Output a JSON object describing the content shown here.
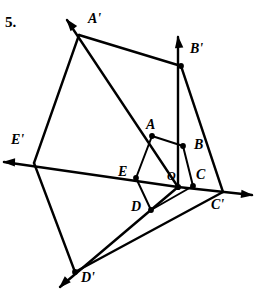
{
  "figure": {
    "problem_number": "5.",
    "stroke_color": "#000000",
    "background_color": "#ffffff",
    "inner_polygon_name": "ABCDE",
    "outer_polygon_name": "A'B'C'D'E'",
    "center_label": "O",
    "labels": {
      "A": "A",
      "B": "B",
      "C": "C",
      "D": "D",
      "E": "E",
      "O": "O",
      "A_prime": "A'",
      "B_prime": "B'",
      "C_prime": "C'",
      "D_prime": "D'",
      "E_prime": "E'"
    },
    "label_positions": {
      "A": {
        "x": 146,
        "y": 118
      },
      "B": {
        "x": 194,
        "y": 138
      },
      "C": {
        "x": 196,
        "y": 168
      },
      "D": {
        "x": 131,
        "y": 200
      },
      "E": {
        "x": 118,
        "y": 165
      },
      "O": {
        "x": 167,
        "y": 170
      },
      "A_prime": {
        "x": 88,
        "y": 12
      },
      "B_prime": {
        "x": 190,
        "y": 42
      },
      "C_prime": {
        "x": 211,
        "y": 198
      },
      "D_prime": {
        "x": 81,
        "y": 271
      },
      "E_prime": {
        "x": 11,
        "y": 133
      }
    },
    "points": {
      "A": {
        "x": 152,
        "y": 136
      },
      "B": {
        "x": 183,
        "y": 146
      },
      "C": {
        "x": 193,
        "y": 186
      },
      "D": {
        "x": 151,
        "y": 210
      },
      "E": {
        "x": 136,
        "y": 178
      },
      "O": {
        "x": 178,
        "y": 187
      },
      "A_prime": {
        "x": 79,
        "y": 35
      },
      "B_prime": {
        "x": 181,
        "y": 66
      },
      "C_prime": {
        "x": 223,
        "y": 192
      },
      "D_prime": {
        "x": 75,
        "y": 272
      },
      "E_prime": {
        "x": 34,
        "y": 163
      }
    },
    "ray_tips": {
      "A_prime": {
        "x": 67,
        "y": 20
      },
      "B_prime": {
        "x": 178,
        "y": 37
      },
      "C_prime": {
        "x": 252,
        "y": 195
      },
      "D_prime": {
        "x": 60,
        "y": 287
      },
      "E_prime": {
        "x": 4,
        "y": 162
      }
    },
    "inner_edges": [
      [
        "A",
        "B"
      ],
      [
        "B",
        "C"
      ],
      [
        "C",
        "D"
      ],
      [
        "D",
        "E"
      ],
      [
        "E",
        "A"
      ]
    ],
    "outer_edges": [
      [
        "A_prime",
        "B_prime"
      ],
      [
        "B_prime",
        "C_prime"
      ],
      [
        "C_prime",
        "D_prime"
      ],
      [
        "D_prime",
        "E_prime"
      ],
      [
        "E_prime",
        "A_prime"
      ]
    ],
    "dilation_rays": [
      [
        "O",
        "A_prime"
      ],
      [
        "O",
        "B_prime"
      ],
      [
        "O",
        "C_prime"
      ],
      [
        "O",
        "D_prime"
      ],
      [
        "O",
        "E_prime"
      ]
    ],
    "dotted_vertices": [
      "A",
      "B",
      "C",
      "D",
      "E",
      "B_prime",
      "D_prime"
    ]
  }
}
